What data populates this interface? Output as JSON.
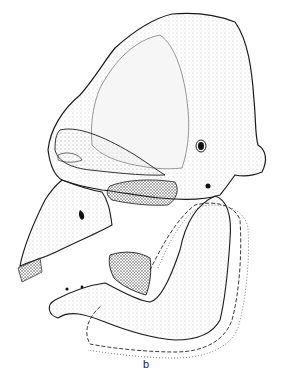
{
  "figure": {
    "panel_label": "b",
    "colors": {
      "ink": "#1a1a1a",
      "stipple": "#9a9a9a",
      "background": "#ffffff"
    }
  }
}
